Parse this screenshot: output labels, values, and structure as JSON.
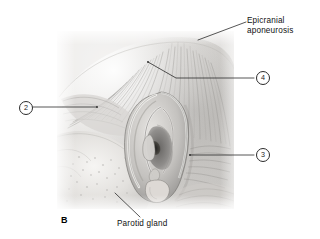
{
  "figure": {
    "letter": "B",
    "panel_background": "#e9e8e6",
    "illustration": "lateral-head-ear-grayscale-anatomy"
  },
  "annotations": {
    "epicranial": {
      "line1": "Epicranial",
      "line2": "aponeurosis"
    },
    "parotid": {
      "label": "Parotid gland"
    }
  },
  "callouts": [
    {
      "number": "2",
      "position": "left"
    },
    {
      "number": "3",
      "position": "right-lower"
    },
    {
      "number": "4",
      "position": "right-upper"
    }
  ],
  "colors": {
    "leader_line": "#2b2b2b",
    "text": "#111111",
    "page_background": "#ffffff"
  }
}
